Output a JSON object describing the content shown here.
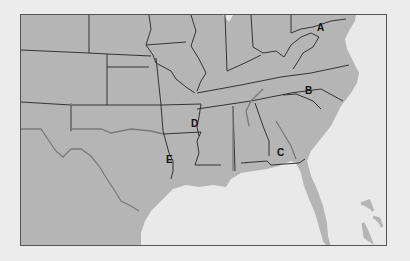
{
  "map": {
    "title": "Southeastern United States",
    "colors": {
      "land": "#b5b5b5",
      "water": "#e9e9e9",
      "state_border": "#333333",
      "river_border": "#7a7a7a",
      "frame": "#555555",
      "background": "#ececec"
    },
    "labels": [
      {
        "id": "A",
        "text": "A",
        "x": 317,
        "y": 23
      },
      {
        "id": "B",
        "text": "B",
        "x": 305,
        "y": 86
      },
      {
        "id": "C",
        "text": "C",
        "x": 277,
        "y": 148
      },
      {
        "id": "D",
        "text": "D",
        "x": 191,
        "y": 119
      },
      {
        "id": "E",
        "text": "E",
        "x": 166,
        "y": 155
      }
    ]
  }
}
